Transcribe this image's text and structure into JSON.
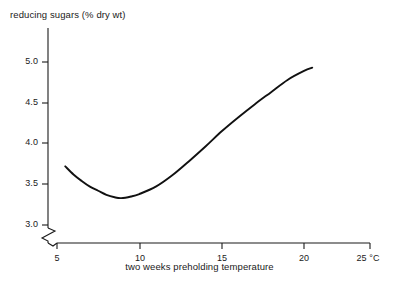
{
  "chart_data": {
    "type": "line",
    "title": "",
    "ylabel": "reducing sugars (% dry wt)",
    "xlabel": "two weeks preholding temperature",
    "x_unit": "°C",
    "xlim": [
      4.45,
      25.0
    ],
    "ylim": [
      2.82,
      5.2
    ],
    "grid": false,
    "legend": null,
    "axis_break_x": true,
    "axis_break_y": true,
    "yticks": [
      {
        "value": 3.0,
        "label": "3.0"
      },
      {
        "value": 3.5,
        "label": "3.5"
      },
      {
        "value": 4.0,
        "label": "4.0"
      },
      {
        "value": 4.5,
        "label": "4.5"
      },
      {
        "value": 5.0,
        "label": "5.0"
      }
    ],
    "xticks": [
      {
        "value": 5,
        "label": "5"
      },
      {
        "value": 10,
        "label": "10"
      },
      {
        "value": 15,
        "label": "15"
      },
      {
        "value": 20,
        "label": "20"
      },
      {
        "value": 25,
        "label": "25 °C"
      }
    ],
    "series": [
      {
        "name": "reducing sugars",
        "x": [
          5.5,
          6.0,
          6.5,
          7.0,
          7.5,
          8.0,
          8.5,
          8.9,
          9.5,
          10.0,
          11.0,
          12.0,
          13.0,
          14.0,
          15.0,
          16.0,
          17.0,
          18.0,
          19.0,
          20.0,
          20.5
        ],
        "values": [
          3.72,
          3.62,
          3.54,
          3.47,
          3.42,
          3.37,
          3.34,
          3.33,
          3.35,
          3.38,
          3.47,
          3.61,
          3.78,
          3.96,
          4.15,
          4.32,
          4.48,
          4.63,
          4.78,
          4.89,
          4.93
        ]
      }
    ],
    "min_point": {
      "x": 8.9,
      "y": 3.33
    }
  },
  "colors": {
    "background": "#ffffff",
    "ink": "#1a1a1a",
    "curve": "#111111"
  }
}
